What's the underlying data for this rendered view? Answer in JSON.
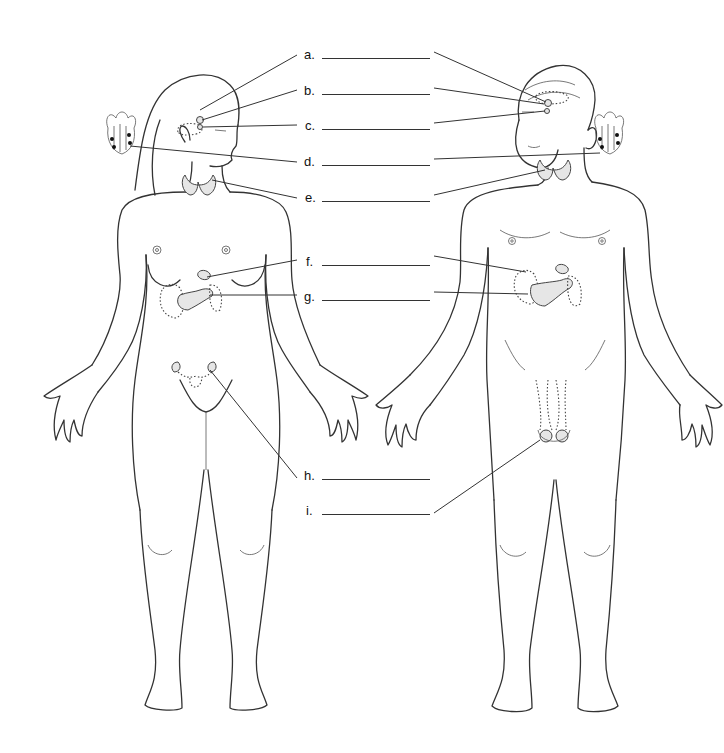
{
  "diagram": {
    "labels": [
      {
        "letter": "a.",
        "answer": "",
        "y": 57
      },
      {
        "letter": "b.",
        "answer": "",
        "y": 93
      },
      {
        "letter": "c.",
        "answer": "",
        "y": 128
      },
      {
        "letter": "d.",
        "answer": "",
        "y": 164
      },
      {
        "letter": "e.",
        "answer": "",
        "y": 200
      },
      {
        "letter": "f.",
        "answer": "",
        "y": 264
      },
      {
        "letter": "g.",
        "answer": "",
        "y": 299
      },
      {
        "letter": "h.",
        "answer": "",
        "y": 478
      },
      {
        "letter": "i.",
        "answer": "",
        "y": 513
      }
    ],
    "figures": [
      "female-figure",
      "male-figure"
    ],
    "insets": [
      "parathyroid-inset-left",
      "parathyroid-inset-right"
    ],
    "colors": {
      "line": "#333333",
      "gland_fill": "#e6e6e6",
      "background": "#ffffff"
    }
  }
}
